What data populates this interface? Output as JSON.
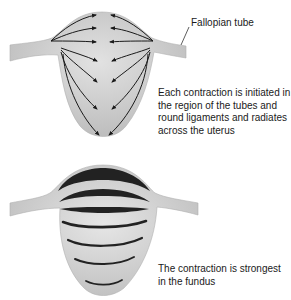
{
  "labels": {
    "fallopian_tube": "Fallopian tube",
    "initiation_caption": "Each contraction is initiated in the region of the tubes and round ligaments and radiates across the uterus",
    "strength_caption": "The contraction is strongest in the fundus"
  },
  "colors": {
    "uterus_fill": "#c4c4c4",
    "uterus_highlight": "#dedede",
    "band_color": "#222222",
    "arrow_color": "#1a1a1a",
    "text_color": "#1a1a1a"
  },
  "figures": [
    {
      "id": "contraction-origin",
      "description": "Arrows radiating from tubal regions across uterus"
    },
    {
      "id": "contraction-strength",
      "description": "Contraction bands thickest at fundus"
    }
  ]
}
